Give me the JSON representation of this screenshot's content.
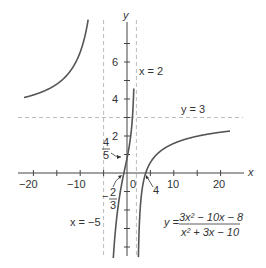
{
  "chart_data": {
    "type": "line",
    "title": "",
    "function": "y = (3x^2 - 10x - 8) / (x^2 + 3x - 10)",
    "equation_label": {
      "prefix": "y =",
      "numerator": "3x² − 10x − 8",
      "denominator": "x² + 3x − 10"
    },
    "xlabel": "x",
    "ylabel": "y",
    "xlim": [
      -23,
      25
    ],
    "ylim": [
      -4.5,
      8
    ],
    "x_ticks": [
      -20,
      -15,
      -10,
      -5,
      5,
      10,
      15,
      20
    ],
    "x_tick_labels": [
      "-20",
      "-10",
      "0",
      "10",
      "20"
    ],
    "y_ticks": [
      -4,
      -3,
      -2,
      -1,
      1,
      2,
      3,
      4,
      5,
      6,
      7
    ],
    "y_tick_labels": [
      "2",
      "4",
      "6"
    ],
    "grid": false,
    "asymptotes": [
      {
        "type": "vertical",
        "value": -5,
        "label": "x = −5"
      },
      {
        "type": "vertical",
        "value": 2,
        "label": "x = 2"
      },
      {
        "type": "horizontal",
        "value": 3,
        "label": "y = 3"
      }
    ],
    "annotations": [
      {
        "text": "4/5",
        "point": [
          0,
          0.8
        ],
        "meaning": "y-intercept"
      },
      {
        "text": "−2/3",
        "point": [
          -0.6667,
          0
        ],
        "meaning": "x-intercept"
      },
      {
        "text": "4",
        "point": [
          4,
          0
        ],
        "meaning": "x-intercept"
      }
    ],
    "branches": [
      {
        "name": "left",
        "x_range": [
          -22,
          -6.6
        ]
      },
      {
        "name": "middle",
        "x_range": [
          -3.6,
          1.45
        ]
      },
      {
        "name": "right",
        "x_range": [
          2.3,
          22
        ]
      }
    ]
  },
  "labels": {
    "x_axis": "x",
    "y_axis": "y",
    "tick_neg20": "−20",
    "tick_neg10": "−10",
    "tick_0": "0",
    "tick_10": "10",
    "tick_20": "20",
    "tick_y2": "2",
    "tick_y4": "4",
    "tick_y6": "6",
    "asym_x2": "x = 2",
    "asym_xneg5": "x = −5",
    "asym_y3": "y = 3",
    "yint_num": "4",
    "yint_den": "5",
    "xint1_num": "2",
    "xint1_den": "3",
    "xint1_sign": "−",
    "xint2": "4",
    "eq_prefix": "y =",
    "eq_num": "3x² − 10x − 8",
    "eq_den": "x² + 3x − 10"
  },
  "colors": {
    "curve": "#555555",
    "axis": "#444444",
    "asymptote": "#bbbbbb"
  }
}
